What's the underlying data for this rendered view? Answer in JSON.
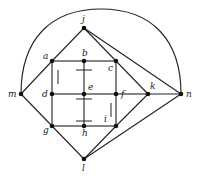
{
  "diagram": {
    "type": "graph",
    "nodes": [
      {
        "id": "j",
        "label": "j",
        "x": 84,
        "y": 28,
        "lx": 82,
        "ly": 22
      },
      {
        "id": "a",
        "label": "a",
        "x": 52,
        "y": 61,
        "lx": 43,
        "ly": 59
      },
      {
        "id": "b",
        "label": "b",
        "x": 84,
        "y": 61,
        "lx": 82,
        "ly": 56
      },
      {
        "id": "c",
        "label": "c",
        "x": 116,
        "y": 61,
        "lx": 108,
        "ly": 71
      },
      {
        "id": "m",
        "label": "m",
        "x": 21,
        "y": 94,
        "lx": 8,
        "ly": 97
      },
      {
        "id": "d",
        "label": "d",
        "x": 52,
        "y": 94,
        "lx": 42,
        "ly": 97
      },
      {
        "id": "e",
        "label": "e",
        "x": 84,
        "y": 94,
        "lx": 88,
        "ly": 90
      },
      {
        "id": "f",
        "label": "f",
        "x": 116,
        "y": 94,
        "lx": 121,
        "ly": 97
      },
      {
        "id": "k",
        "label": "k",
        "x": 148,
        "y": 94,
        "lx": 150,
        "ly": 89
      },
      {
        "id": "n",
        "label": "n",
        "x": 181,
        "y": 94,
        "lx": 186,
        "ly": 97
      },
      {
        "id": "g",
        "label": "g",
        "x": 52,
        "y": 126,
        "lx": 43,
        "ly": 133
      },
      {
        "id": "h",
        "label": "h",
        "x": 84,
        "y": 126,
        "lx": 82,
        "ly": 136
      },
      {
        "id": "i",
        "label": "i",
        "x": 116,
        "y": 126,
        "lx": 104,
        "ly": 122
      },
      {
        "id": "l",
        "label": "l",
        "x": 84,
        "y": 159,
        "lx": 82,
        "ly": 171
      }
    ],
    "edges": [
      [
        "j",
        "a"
      ],
      [
        "j",
        "c"
      ],
      [
        "j",
        "n"
      ],
      [
        "a",
        "b"
      ],
      [
        "b",
        "c"
      ],
      [
        "a",
        "d"
      ],
      [
        "d",
        "g"
      ],
      [
        "c",
        "f"
      ],
      [
        "f",
        "i"
      ],
      [
        "b",
        "e"
      ],
      [
        "e",
        "h"
      ],
      [
        "d",
        "e"
      ],
      [
        "e",
        "f"
      ],
      [
        "g",
        "h"
      ],
      [
        "h",
        "i"
      ],
      [
        "m",
        "a"
      ],
      [
        "m",
        "g"
      ],
      [
        "c",
        "k"
      ],
      [
        "k",
        "n"
      ],
      [
        "k",
        "i"
      ],
      [
        "l",
        "g"
      ],
      [
        "l",
        "i"
      ],
      [
        "l",
        "n"
      ],
      [
        "f",
        "k"
      ]
    ],
    "arc": {
      "from": "m",
      "to": "n",
      "path": "M21,94 C21,40 50,9 101,9 C152,9 181,40 181,94"
    },
    "ticks": [
      {
        "x1": 76,
        "y1": 70,
        "x2": 92,
        "y2": 70
      },
      {
        "x1": 76,
        "y1": 99,
        "x2": 92,
        "y2": 99
      },
      {
        "x1": 76,
        "y1": 121,
        "x2": 92,
        "y2": 121
      },
      {
        "x1": 58,
        "y1": 70,
        "x2": 58,
        "y2": 84
      },
      {
        "x1": 111,
        "y1": 103,
        "x2": 111,
        "y2": 117
      }
    ]
  }
}
